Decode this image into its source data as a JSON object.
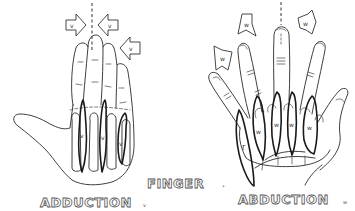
{
  "figure": {
    "title_center": "FINGER",
    "title_center_suffix": "•",
    "left_panel": {
      "label": "ADDUCTION",
      "label_suffix": "v",
      "arrow_labels": [
        "v",
        "v",
        "v"
      ],
      "muscle_labels": [
        "v",
        "v",
        "v"
      ]
    },
    "right_panel": {
      "label": "ABDUCTION",
      "label_suffix": "w",
      "arrow_labels": [
        "w",
        "w",
        "w"
      ],
      "muscle_labels": [
        "w",
        "w",
        "w",
        "w"
      ],
      "extra_muscle_label": "r"
    }
  },
  "colors": {
    "ink": "#2a2a2a",
    "background": "#ffffff"
  }
}
